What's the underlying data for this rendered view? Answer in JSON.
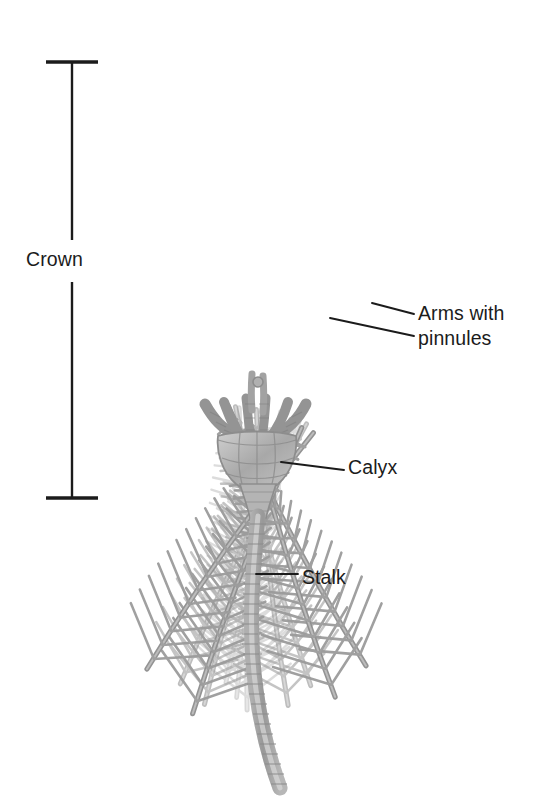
{
  "figure": {
    "background_color": "#ffffff",
    "ink_color": "#1b1b1b",
    "specimen_color": "#9a9a9a",
    "specimen_color_light": "#cccccc",
    "specimen_color_faint": "#e2e2e2"
  },
  "labels": {
    "crown": "Crown",
    "arms_line1": "Arms with",
    "arms_line2": "pinnules",
    "calyx": "Calyx",
    "stalk": "Stalk"
  },
  "measure": {
    "name": "crown-extent-bracket",
    "axis_x": 72,
    "top_y": 62,
    "bottom_y": 498,
    "tick_half_width": 26
  },
  "leaders": {
    "arms_upper": {
      "x1": 372,
      "y1": 303,
      "x2": 414,
      "y2": 314
    },
    "arms_lower": {
      "x1": 330,
      "y1": 318,
      "x2": 414,
      "y2": 336
    },
    "calyx": {
      "x1": 281,
      "y1": 462,
      "x2": 344,
      "y2": 470
    },
    "stalk": {
      "x1": 256,
      "y1": 574,
      "x2": 298,
      "y2": 574
    }
  }
}
